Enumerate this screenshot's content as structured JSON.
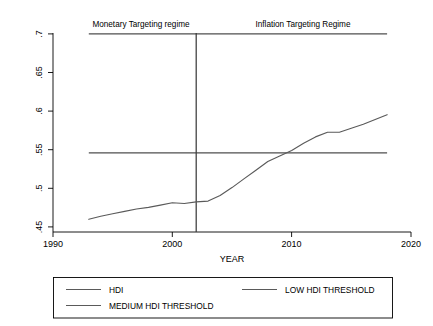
{
  "chart_data": {
    "type": "line",
    "title": "",
    "xlabel": "YEAR",
    "ylabel": "",
    "xlim": [
      1990,
      2020
    ],
    "ylim": [
      0.45,
      0.7
    ],
    "xticks": [
      "1990",
      "2000",
      "2010",
      "2020"
    ],
    "xtick_values": [
      1990,
      2000,
      2010,
      2020
    ],
    "yticks": [
      ".45",
      ".5",
      ".55",
      ".6",
      ".65",
      ".7"
    ],
    "ytick_values": [
      0.45,
      0.5,
      0.55,
      0.6,
      0.65,
      0.7
    ],
    "grid": false,
    "legend_position": "below-plot",
    "x": [
      1993,
      1994,
      1995,
      1996,
      1997,
      1998,
      1999,
      2000,
      2001,
      2002,
      2003,
      2004,
      2005,
      2006,
      2007,
      2008,
      2009,
      2010,
      2011,
      2012,
      2013,
      2014,
      2015,
      2016,
      2017,
      2018
    ],
    "series": [
      {
        "name": "HDI",
        "color": "#5a5a5a",
        "values": [
          0.466,
          0.47,
          0.473,
          0.476,
          0.479,
          0.481,
          0.484,
          0.487,
          0.486,
          0.488,
          0.489,
          0.496,
          0.506,
          0.517,
          0.528,
          0.539,
          0.546,
          0.553,
          0.562,
          0.57,
          0.576,
          0.576,
          0.581,
          0.586,
          0.592,
          0.598
        ]
      }
    ],
    "threshold_lines": [
      {
        "name": "LOW HDI THRESHOLD",
        "value": 0.55,
        "color": "#4f4f4f",
        "x_start": 1993,
        "x_end": 2018
      },
      {
        "name": "MEDIUM HDI THRESHOLD",
        "value": 0.7,
        "color": "#4f4f4f",
        "x_start": 1993,
        "x_end": 2018
      }
    ],
    "vertical_markers": [
      {
        "name": "regime-divider",
        "value": 2002,
        "color": "#3c3c3c"
      }
    ],
    "annotations": [
      {
        "name": "monetary-targeting-regime",
        "text": "Monetary Targeting regime",
        "x": 1996.3,
        "y": 0.712
      },
      {
        "name": "inflation-targeting-regime",
        "text": "Inflation Targeting Regime",
        "x": 2009.8,
        "y": 0.712
      }
    ],
    "legend": [
      {
        "label": "HDI",
        "color": "#5a5a5a"
      },
      {
        "label": "LOW HDI THRESHOLD",
        "color": "#5a5a5a"
      },
      {
        "label": "MEDIUM HDI THRESHOLD",
        "color": "#5a5a5a"
      }
    ]
  }
}
